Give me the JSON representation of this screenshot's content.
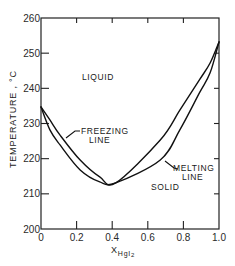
{
  "chart_data": {
    "type": "line",
    "title": "",
    "xlabel": "X_HgI2",
    "xlabel_main": "X",
    "xlabel_sub": "HgI",
    "xlabel_sub2": "2",
    "ylabel": "TEMPERATURE , °C",
    "xlim": [
      0,
      1.0
    ],
    "ylim": [
      200,
      260
    ],
    "x_ticks": [
      "0",
      "0.2",
      "0.4",
      "0.6",
      "0.8",
      "1.0"
    ],
    "y_ticks": [
      "200",
      "210",
      "220",
      "230",
      "240",
      "250",
      "260"
    ],
    "grid": false,
    "legend": null,
    "series": [
      {
        "name": "Freezing line",
        "x": [
          0.0,
          0.05,
          0.107,
          0.22,
          0.33,
          0.42,
          0.67,
          0.78,
          0.89,
          0.95,
          1.0
        ],
        "y": [
          234.7,
          231.0,
          226.7,
          219.6,
          214.8,
          213.1,
          225.3,
          233.8,
          242.4,
          247.2,
          253.2
        ]
      },
      {
        "name": "Melting line",
        "x": [
          0.0,
          0.05,
          0.107,
          0.22,
          0.33,
          0.42,
          0.67,
          0.78,
          0.89,
          0.95,
          1.0
        ],
        "y": [
          234.7,
          228.2,
          223.9,
          216.8,
          213.4,
          213.1,
          219.6,
          228.2,
          238.7,
          244.4,
          253.2
        ]
      }
    ],
    "annotations": [
      {
        "text": "LIQUID",
        "x": 0.27,
        "y": 239
      },
      {
        "text": "SOLID",
        "x": 0.68,
        "y": 207.5
      },
      {
        "text": "FREEZING",
        "x": 0.27,
        "y": 225.5
      },
      {
        "text": "LINE",
        "x": 0.3,
        "y": 222
      },
      {
        "text": "MELTING",
        "x": 0.77,
        "y": 217.5
      },
      {
        "text": "LINE",
        "x": 0.8,
        "y": 214.5
      }
    ]
  },
  "labels": {
    "liquid": "LIQUID",
    "solid": "SOLID",
    "freezing_1": "FREEZING",
    "freezing_2": "LINE",
    "melting_1": "MELTING",
    "melting_2": "LINE",
    "ylabel": "TEMPERATURE , °C",
    "xlabel_main": "X",
    "xlabel_sub": "HgI",
    "xlabel_sub2": "2"
  },
  "colors": {
    "ink": "#111111",
    "background": "#ffffff"
  }
}
